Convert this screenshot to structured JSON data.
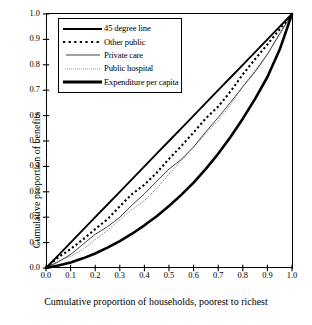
{
  "chart_data": {
    "type": "line",
    "title": "",
    "subtitle": "",
    "xlabel": "Cumulative proportion of households, poorest to richest",
    "ylabel": "Cumulative proportion of benefits",
    "xlim": [
      0.0,
      1.0
    ],
    "ylim": [
      0.0,
      1.0
    ],
    "grid": false,
    "legend_position": "upper-left-inside",
    "xticks": [
      "0.0",
      "0.1",
      "0.2",
      "0.3",
      "0.4",
      "0.5",
      "0.6",
      "0.7",
      "0.8",
      "0.9",
      "1.0"
    ],
    "yticks": [
      "0.0",
      "0.1",
      "0.2",
      "0.3",
      "0.4",
      "0.5",
      "0.6",
      "0.7",
      "0.8",
      "0.9",
      "1.0"
    ],
    "x": [
      0.0,
      0.05,
      0.1,
      0.15,
      0.2,
      0.25,
      0.3,
      0.35,
      0.4,
      0.45,
      0.5,
      0.55,
      0.6,
      0.65,
      0.7,
      0.75,
      0.8,
      0.85,
      0.9,
      0.95,
      1.0
    ],
    "series": [
      {
        "name": "45 degree line",
        "style": "solid",
        "width": 1.9,
        "color": "#000000",
        "values": [
          0.0,
          0.05,
          0.1,
          0.15,
          0.2,
          0.25,
          0.3,
          0.35,
          0.4,
          0.45,
          0.5,
          0.55,
          0.6,
          0.65,
          0.7,
          0.75,
          0.8,
          0.85,
          0.9,
          0.95,
          1.0
        ]
      },
      {
        "name": "Other public",
        "style": "dotted-bold",
        "width": 2.1,
        "color": "#000000",
        "values": [
          0.0,
          0.035,
          0.075,
          0.115,
          0.155,
          0.195,
          0.24,
          0.285,
          0.33,
          0.38,
          0.43,
          0.48,
          0.53,
          0.585,
          0.64,
          0.7,
          0.76,
          0.82,
          0.878,
          0.938,
          1.0
        ]
      },
      {
        "name": "Private care",
        "style": "solid-thin",
        "width": 0.75,
        "color": "#000000",
        "values": [
          0.0,
          0.026,
          0.056,
          0.09,
          0.126,
          0.165,
          0.205,
          0.248,
          0.292,
          0.338,
          0.385,
          0.432,
          0.482,
          0.534,
          0.59,
          0.65,
          0.712,
          0.778,
          0.845,
          0.918,
          1.0
        ]
      },
      {
        "name": "Public hospital",
        "style": "dotted-fine",
        "width": 0.8,
        "color": "#555555",
        "values": [
          0.0,
          0.022,
          0.048,
          0.078,
          0.112,
          0.148,
          0.186,
          0.226,
          0.27,
          0.318,
          0.368,
          0.42,
          0.474,
          0.528,
          0.586,
          0.646,
          0.71,
          0.776,
          0.844,
          0.918,
          1.0
        ]
      },
      {
        "name": "Expenditure per capita",
        "style": "solid-thick",
        "width": 2.6,
        "color": "#000000",
        "values": [
          0.0,
          0.01,
          0.022,
          0.038,
          0.057,
          0.08,
          0.106,
          0.135,
          0.168,
          0.204,
          0.244,
          0.288,
          0.336,
          0.39,
          0.45,
          0.516,
          0.588,
          0.666,
          0.752,
          0.86,
          1.0
        ]
      }
    ]
  },
  "legend": {
    "items": [
      {
        "label": "45 degree line"
      },
      {
        "label": "Other public"
      },
      {
        "label": "Private care"
      },
      {
        "label": "Public hospital"
      },
      {
        "label": "Expenditure per capita"
      }
    ]
  },
  "axes": {
    "x_title": "Cumulative proportion of households, poorest to richest",
    "y_title": "Cumulative proportion of benefits"
  }
}
